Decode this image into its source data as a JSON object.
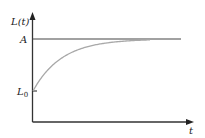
{
  "figure": {
    "y_axis_label": "L(t)",
    "x_axis_label": "t",
    "asymptote_label": "A",
    "initial_label_base": "L",
    "initial_label_sub": "0"
  },
  "chart_data": {
    "type": "line",
    "title": "",
    "xlabel": "t",
    "ylabel": "L(t)",
    "grid": false,
    "annotations": [
      "A (horizontal asymptote)",
      "L0 (initial value)"
    ],
    "series": [
      {
        "name": "L(t) = A - (A - L0) e^{-kt}",
        "style": "gray curve",
        "description": "rises from L0 at t=0, approaching A asymptotically"
      },
      {
        "name": "A",
        "style": "horizontal line",
        "description": "constant level A"
      }
    ]
  },
  "colors": {
    "axis": "#333333",
    "asymptote": "#444444",
    "curve": "#a8a8a8"
  }
}
